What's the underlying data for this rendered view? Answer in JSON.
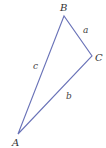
{
  "diagram": {
    "type": "triangle",
    "stroke_color": "#6a73b8",
    "vertices": [
      {
        "label": "A",
        "x": 18,
        "y": 134,
        "label_x": 12,
        "label_y": 146
      },
      {
        "label": "B",
        "x": 64,
        "y": 16,
        "label_x": 60,
        "label_y": 11
      },
      {
        "label": "C",
        "x": 92,
        "y": 56,
        "label_x": 95,
        "label_y": 61
      }
    ],
    "sides": [
      {
        "label": "a",
        "from": "B",
        "to": "C",
        "label_x": 83,
        "label_y": 33
      },
      {
        "label": "b",
        "from": "A",
        "to": "C",
        "label_x": 66,
        "label_y": 99
      },
      {
        "label": "c",
        "from": "A",
        "to": "B",
        "label_x": 33,
        "label_y": 69
      }
    ]
  }
}
